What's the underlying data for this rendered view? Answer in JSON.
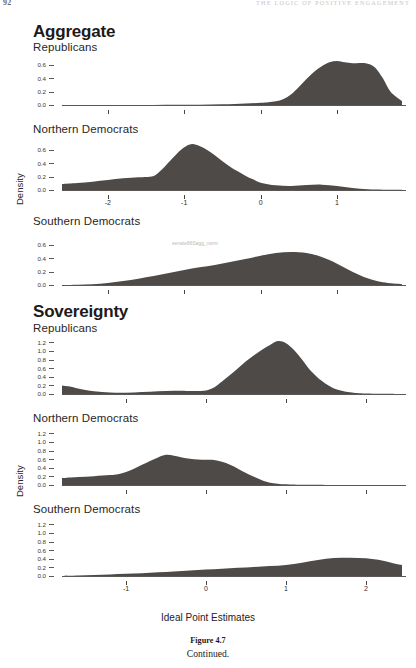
{
  "page": {
    "folio": "92",
    "running_head": "THE LOGIC OF POSITIVE ENGAGEMENT"
  },
  "sections": [
    {
      "title": "Aggregate"
    },
    {
      "title": "Sovereignty"
    }
  ],
  "axis": {
    "ylabel": "Density",
    "xlabel": "Ideal Point Estimates"
  },
  "watermark": "senate86Sagg_norm",
  "caption": {
    "number": "Figure 4.7",
    "text": "Continued."
  },
  "chart_data": [
    {
      "type": "area",
      "title": "Aggregate",
      "subtitle": "Republicans",
      "xlabel": "",
      "ylabel": "Density",
      "xlim": [
        -2.6,
        1.85
      ],
      "ylim": [
        0.0,
        0.72
      ],
      "xticks": [
        -2,
        -1,
        0,
        1
      ],
      "xticklabels": [
        "",
        "",
        "",
        ""
      ],
      "yticks": [
        0.0,
        0.2,
        0.4,
        0.6
      ],
      "yticklabels": [
        "0.0",
        "0.2",
        "0.4",
        "0.6"
      ],
      "grid": false,
      "x": [
        -2.6,
        -2.3,
        -2.0,
        -1.7,
        -1.4,
        -1.1,
        -0.8,
        -0.5,
        -0.2,
        0.0,
        0.1,
        0.2,
        0.3,
        0.4,
        0.5,
        0.6,
        0.7,
        0.8,
        0.9,
        1.0,
        1.1,
        1.2,
        1.3,
        1.4,
        1.5,
        1.6,
        1.7,
        1.85
      ],
      "y": [
        0.0,
        0.0,
        0.0,
        0.0,
        0.0,
        0.002,
        0.004,
        0.01,
        0.022,
        0.032,
        0.04,
        0.055,
        0.09,
        0.16,
        0.27,
        0.39,
        0.5,
        0.58,
        0.64,
        0.66,
        0.64,
        0.625,
        0.63,
        0.62,
        0.56,
        0.4,
        0.2,
        0.06
      ]
    },
    {
      "type": "area",
      "title": "Aggregate",
      "subtitle": "Northern Democrats",
      "xlabel": "",
      "ylabel": "Density",
      "xlim": [
        -2.6,
        1.85
      ],
      "ylim": [
        0.0,
        0.72
      ],
      "xticks": [
        -2,
        -1,
        0,
        1
      ],
      "xticklabels": [
        "-2",
        "-1",
        "0",
        "1"
      ],
      "yticks": [
        0.0,
        0.2,
        0.4,
        0.6
      ],
      "yticklabels": [
        "0.0",
        "0.2",
        "0.4",
        "0.6"
      ],
      "grid": false,
      "x": [
        -2.6,
        -2.4,
        -2.2,
        -2.0,
        -1.8,
        -1.6,
        -1.5,
        -1.4,
        -1.3,
        -1.2,
        -1.1,
        -1.0,
        -0.9,
        -0.8,
        -0.7,
        -0.6,
        -0.5,
        -0.4,
        -0.3,
        -0.2,
        -0.1,
        0.0,
        0.2,
        0.4,
        0.6,
        0.8,
        1.0,
        1.2,
        1.4,
        1.6,
        1.85
      ],
      "y": [
        0.09,
        0.105,
        0.125,
        0.15,
        0.175,
        0.19,
        0.195,
        0.21,
        0.3,
        0.42,
        0.54,
        0.64,
        0.69,
        0.66,
        0.6,
        0.52,
        0.43,
        0.35,
        0.28,
        0.215,
        0.16,
        0.11,
        0.07,
        0.06,
        0.075,
        0.08,
        0.06,
        0.03,
        0.01,
        0.004,
        0.002
      ]
    },
    {
      "type": "area",
      "title": "Aggregate",
      "subtitle": "Southern Democrats",
      "xlabel": "",
      "ylabel": "Density",
      "xlim": [
        -2.6,
        1.85
      ],
      "ylim": [
        0.0,
        0.72
      ],
      "xticks": [
        -2,
        -1,
        0,
        1
      ],
      "xticklabels": [
        "",
        "",
        "",
        ""
      ],
      "yticks": [
        0.0,
        0.2,
        0.4,
        0.6
      ],
      "yticklabels": [
        "0.0",
        "0.2",
        "0.4",
        "0.6"
      ],
      "grid": false,
      "x": [
        -2.6,
        -2.4,
        -2.2,
        -2.0,
        -1.8,
        -1.6,
        -1.4,
        -1.2,
        -1.0,
        -0.8,
        -0.6,
        -0.4,
        -0.2,
        0.0,
        0.2,
        0.4,
        0.6,
        0.8,
        1.0,
        1.2,
        1.4,
        1.6,
        1.85
      ],
      "y": [
        0.0,
        0.004,
        0.012,
        0.03,
        0.06,
        0.095,
        0.135,
        0.18,
        0.225,
        0.265,
        0.3,
        0.345,
        0.39,
        0.44,
        0.48,
        0.495,
        0.48,
        0.42,
        0.32,
        0.2,
        0.1,
        0.04,
        0.012
      ]
    },
    {
      "type": "area",
      "title": "Sovereignty",
      "subtitle": "Republicans",
      "xlabel": "",
      "ylabel": "Density",
      "xlim": [
        -1.8,
        2.45
      ],
      "ylim": [
        0.0,
        1.3
      ],
      "xticks": [
        -1,
        0,
        1,
        2
      ],
      "xticklabels": [
        "",
        "",
        "",
        ""
      ],
      "yticks": [
        0.0,
        0.2,
        0.4,
        0.6,
        0.8,
        1.0,
        1.2
      ],
      "yticklabels": [
        "0.0",
        "0.2",
        "0.4",
        "0.6",
        "0.8",
        "1.0",
        "1.2"
      ],
      "grid": false,
      "x": [
        -1.8,
        -1.7,
        -1.6,
        -1.4,
        -1.2,
        -1.0,
        -0.8,
        -0.6,
        -0.4,
        -0.2,
        -0.1,
        0.0,
        0.1,
        0.2,
        0.3,
        0.4,
        0.5,
        0.6,
        0.7,
        0.8,
        0.9,
        1.0,
        1.1,
        1.2,
        1.3,
        1.45,
        1.6,
        1.8,
        2.0,
        2.45
      ],
      "y": [
        0.2,
        0.175,
        0.13,
        0.065,
        0.035,
        0.03,
        0.045,
        0.065,
        0.075,
        0.07,
        0.07,
        0.08,
        0.15,
        0.29,
        0.44,
        0.6,
        0.76,
        0.9,
        1.03,
        1.14,
        1.23,
        1.18,
        1.02,
        0.8,
        0.56,
        0.3,
        0.13,
        0.04,
        0.01,
        0.0
      ]
    },
    {
      "type": "area",
      "title": "Sovereignty",
      "subtitle": "Northern Democrats",
      "xlabel": "",
      "ylabel": "Density",
      "xlim": [
        -1.8,
        2.45
      ],
      "ylim": [
        0.0,
        1.3
      ],
      "xticks": [
        -1,
        0,
        1,
        2
      ],
      "xticklabels": [
        "",
        "",
        "",
        ""
      ],
      "yticks": [
        0.0,
        0.2,
        0.4,
        0.6,
        0.8,
        1.0,
        1.2
      ],
      "yticklabels": [
        "0.0",
        "0.2",
        "0.4",
        "0.6",
        "0.8",
        "1.0",
        "1.2"
      ],
      "grid": false,
      "x": [
        -1.8,
        -1.6,
        -1.4,
        -1.2,
        -1.1,
        -1.0,
        -0.9,
        -0.8,
        -0.7,
        -0.6,
        -0.5,
        -0.4,
        -0.3,
        -0.2,
        -0.1,
        0.0,
        0.1,
        0.2,
        0.3,
        0.4,
        0.5,
        0.6,
        0.7,
        0.8,
        1.0,
        1.2,
        1.5,
        2.0,
        2.45
      ],
      "y": [
        0.16,
        0.185,
        0.205,
        0.23,
        0.25,
        0.3,
        0.38,
        0.47,
        0.56,
        0.64,
        0.7,
        0.68,
        0.64,
        0.61,
        0.59,
        0.585,
        0.58,
        0.54,
        0.47,
        0.38,
        0.28,
        0.19,
        0.11,
        0.055,
        0.015,
        0.005,
        0.002,
        0.0,
        0.0
      ]
    },
    {
      "type": "area",
      "title": "Sovereignty",
      "subtitle": "Southern Democrats",
      "xlabel": "Ideal Point Estimates",
      "ylabel": "Density",
      "xlim": [
        -1.8,
        2.45
      ],
      "ylim": [
        0.0,
        1.3
      ],
      "xticks": [
        -1,
        0,
        1,
        2
      ],
      "xticklabels": [
        "-1",
        "0",
        "1",
        "2"
      ],
      "yticks": [
        0.0,
        0.2,
        0.4,
        0.6,
        0.8,
        1.0,
        1.2
      ],
      "yticklabels": [
        "0.0",
        "0.2",
        "0.4",
        "0.6",
        "0.8",
        "1.0",
        "1.2"
      ],
      "grid": false,
      "x": [
        -1.8,
        -1.6,
        -1.4,
        -1.2,
        -1.0,
        -0.8,
        -0.6,
        -0.4,
        -0.2,
        0.0,
        0.2,
        0.4,
        0.6,
        0.8,
        1.0,
        1.2,
        1.4,
        1.6,
        1.8,
        2.0,
        2.2,
        2.35,
        2.45
      ],
      "y": [
        0.0,
        0.01,
        0.022,
        0.035,
        0.05,
        0.065,
        0.085,
        0.105,
        0.125,
        0.15,
        0.17,
        0.19,
        0.21,
        0.23,
        0.255,
        0.31,
        0.37,
        0.415,
        0.425,
        0.41,
        0.36,
        0.29,
        0.255
      ]
    }
  ],
  "style": {
    "fill": "#4d4a48",
    "axis": "#5b5755",
    "text": "#231f1e"
  }
}
